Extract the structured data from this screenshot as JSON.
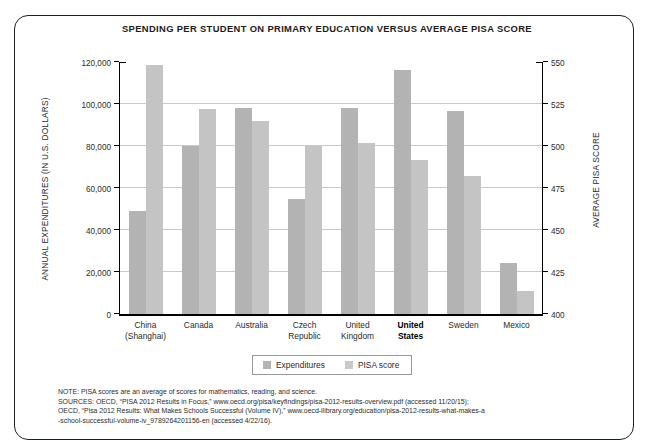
{
  "chart_data": {
    "type": "bar",
    "title": "SPENDING PER STUDENT ON PRIMARY EDUCATION  VERSUS AVERAGE PISA SCORE",
    "categories": [
      "China (Shanghai)",
      "Canada",
      "Australia",
      "Czech Republic",
      "United Kingdom",
      "United States",
      "Sweden",
      "Mexico"
    ],
    "series": [
      {
        "name": "Expenditures",
        "axis": "left",
        "color": "#b3b3b3",
        "values": [
          49000,
          80000,
          98000,
          55000,
          98000,
          116000,
          96500,
          24500
        ]
      },
      {
        "name": "PISA score",
        "axis": "right",
        "color": "#c4c4c4",
        "values": [
          548,
          522,
          515,
          500,
          502,
          492,
          482,
          414
        ]
      }
    ],
    "xlabel": "",
    "ylabel": "ANNUAL EXPENDITURES (IN U.S. DOLLARS)",
    "ylabel_right": "AVERAGE PISA SCORE",
    "ylim": [
      0,
      120000
    ],
    "ylim_right": [
      400,
      550
    ],
    "yticks": [
      0,
      20000,
      40000,
      60000,
      80000,
      100000,
      120000
    ],
    "ytick_labels": [
      "0",
      "20,000",
      "40,000",
      "60,000",
      "80,000",
      "100,000",
      "120,000"
    ],
    "yticks_right": [
      400,
      425,
      450,
      475,
      500,
      525,
      550
    ],
    "ytick_labels_right": [
      "400",
      "425",
      "450",
      "475",
      "500",
      "525",
      "550"
    ],
    "grid": true,
    "legend_position": "bottom-center",
    "highlighted_category": "United States"
  },
  "categories_display": [
    {
      "line1": "China",
      "line2": "(Shanghai)",
      "bold": false
    },
    {
      "line1": "Canada",
      "line2": "",
      "bold": false
    },
    {
      "line1": "Australia",
      "line2": "",
      "bold": false
    },
    {
      "line1": "Czech",
      "line2": "Republic",
      "bold": false
    },
    {
      "line1": "United",
      "line2": "Kingdom",
      "bold": false
    },
    {
      "line1": "United",
      "line2": "States",
      "bold": true
    },
    {
      "line1": "Sweden",
      "line2": "",
      "bold": false
    },
    {
      "line1": "Mexico",
      "line2": "",
      "bold": false
    }
  ],
  "legend": {
    "items": [
      {
        "label": "Expenditures",
        "color": "#b3b3b3"
      },
      {
        "label": "PISA score",
        "color": "#c9c9c9"
      }
    ]
  },
  "notes": {
    "line1": "NOTE: PISA scores are an average of scores for mathematics, reading, and science.",
    "line2": "SOURCES: OECD, “PISA 2012 Results in Focus,” www.oecd.org/pisa/keyfindings/pisa-2012-results-overview.pdf (accessed 11/20/15);",
    "line3": "OECD, “Pisa 2012 Results: What Makes Schools Successful (Volume IV),” www.oecd-ilibrary.org/education/pisa-2012-results-what-makes-a",
    "line4": "-school-successful-volume-iv_9789264201156-en (accessed 4/22/16)."
  }
}
